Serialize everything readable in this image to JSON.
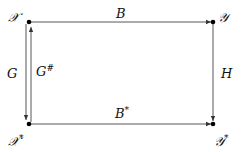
{
  "diagram": {
    "type": "commutative-square",
    "nodes": {
      "top_left": {
        "label": "𝒳",
        "sup": ""
      },
      "top_right": {
        "label": "𝒴",
        "sup": ""
      },
      "bottom_left": {
        "label": "𝒳",
        "sup": "*"
      },
      "bottom_right": {
        "label": "𝒴",
        "sup": "*"
      }
    },
    "arrows": {
      "top": {
        "label": "B",
        "sup": "",
        "from": "top_left",
        "to": "top_right"
      },
      "bottom": {
        "label": "B",
        "sup": "*",
        "from": "bottom_left",
        "to": "bottom_right"
      },
      "left_down": {
        "label": "G",
        "sup": "",
        "from": "top_left",
        "to": "bottom_left"
      },
      "left_up": {
        "label": "G",
        "sup": "#",
        "from": "bottom_left",
        "to": "top_left"
      },
      "right": {
        "label": "H",
        "sup": "",
        "from": "top_right",
        "to": "bottom_right"
      }
    },
    "colors": {
      "line": "#333333",
      "node": "#000000",
      "text": "#111111"
    }
  }
}
